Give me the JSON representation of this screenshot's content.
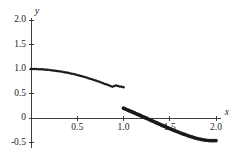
{
  "chart_data": {
    "type": "scatter",
    "title": "",
    "subtitle": "",
    "xlabel": "x",
    "ylabel": "y",
    "xlim": [
      0,
      2.05
    ],
    "ylim": [
      -0.62,
      2.05
    ],
    "grid": false,
    "legend": null,
    "legend_position": "none",
    "annotations": [
      "jump discontinuity at x = 1.0"
    ],
    "x_ticks": [
      {
        "value": 0.5,
        "label": "0.5"
      },
      {
        "value": 1.0,
        "label": "1.0"
      },
      {
        "value": 1.5,
        "label": "1.5"
      },
      {
        "value": 2.0,
        "label": "2.0"
      }
    ],
    "y_ticks": [
      {
        "value": 2.0,
        "label": "2.0"
      },
      {
        "value": 1.5,
        "label": "1.5"
      },
      {
        "value": 1.0,
        "label": "1.0"
      },
      {
        "value": 0.5,
        "label": "0.5"
      },
      {
        "value": 0.0,
        "label": "0"
      },
      {
        "value": -0.5,
        "label": "-0.5"
      }
    ],
    "series": [
      {
        "name": "branch-left",
        "style": "dotted",
        "marker": "dot",
        "marker_size": 1.25,
        "color": "#1a1a1a",
        "x_range": [
          0.0,
          1.0
        ],
        "points": [
          [
            0.0,
            1.0
          ],
          [
            0.04,
            0.999
          ],
          [
            0.08,
            0.997
          ],
          [
            0.12,
            0.993
          ],
          [
            0.16,
            0.987
          ],
          [
            0.2,
            0.98
          ],
          [
            0.24,
            0.971
          ],
          [
            0.28,
            0.961
          ],
          [
            0.32,
            0.949
          ],
          [
            0.36,
            0.936
          ],
          [
            0.4,
            0.921
          ],
          [
            0.44,
            0.905
          ],
          [
            0.48,
            0.887
          ],
          [
            0.52,
            0.868
          ],
          [
            0.56,
            0.847
          ],
          [
            0.6,
            0.825
          ],
          [
            0.64,
            0.802
          ],
          [
            0.68,
            0.777
          ],
          [
            0.72,
            0.751
          ],
          [
            0.76,
            0.724
          ],
          [
            0.8,
            0.696
          ],
          [
            0.84,
            0.667
          ],
          [
            0.88,
            0.637
          ],
          [
            0.92,
            0.665
          ],
          [
            0.96,
            0.645
          ],
          [
            1.0,
            0.63
          ]
        ]
      },
      {
        "name": "branch-right",
        "style": "dotted-thick",
        "marker": "dot",
        "marker_size": 1.85,
        "color": "#1a1a1a",
        "x_range": [
          1.0,
          2.0
        ],
        "points": [
          [
            1.0,
            0.2
          ],
          [
            1.04,
            0.168
          ],
          [
            1.08,
            0.136
          ],
          [
            1.12,
            0.103
          ],
          [
            1.16,
            0.07
          ],
          [
            1.2,
            0.036
          ],
          [
            1.24,
            0.002
          ],
          [
            1.28,
            -0.032
          ],
          [
            1.32,
            -0.066
          ],
          [
            1.36,
            -0.1
          ],
          [
            1.4,
            -0.134
          ],
          [
            1.44,
            -0.167
          ],
          [
            1.48,
            -0.2
          ],
          [
            1.52,
            -0.232
          ],
          [
            1.56,
            -0.263
          ],
          [
            1.6,
            -0.293
          ],
          [
            1.64,
            -0.322
          ],
          [
            1.68,
            -0.349
          ],
          [
            1.72,
            -0.375
          ],
          [
            1.76,
            -0.399
          ],
          [
            1.8,
            -0.42
          ],
          [
            1.84,
            -0.437
          ],
          [
            1.88,
            -0.45
          ],
          [
            1.92,
            -0.459
          ],
          [
            1.96,
            -0.462
          ],
          [
            2.0,
            -0.46
          ]
        ]
      }
    ]
  }
}
